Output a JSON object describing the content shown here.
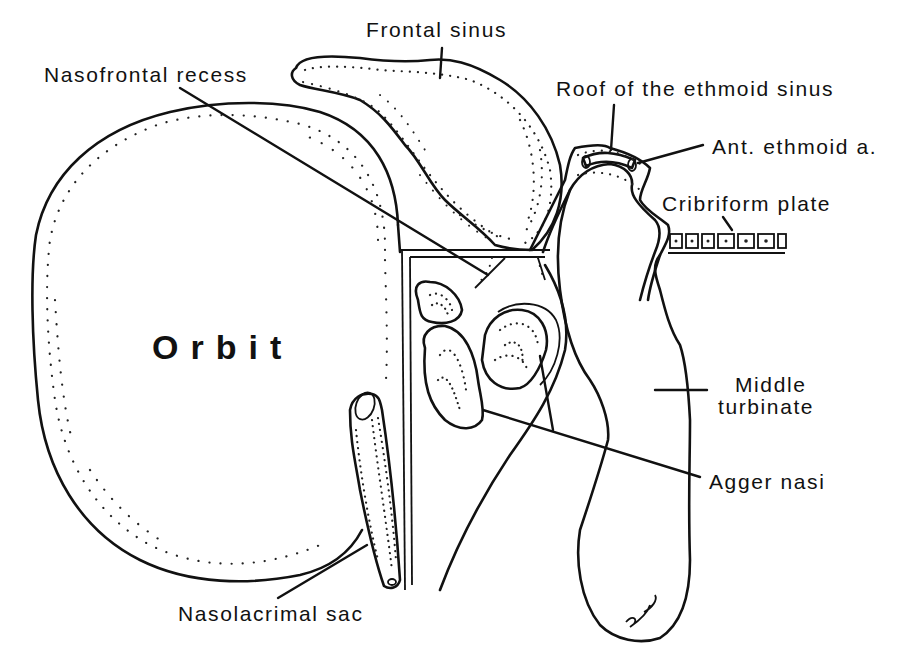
{
  "figure": {
    "type": "anatomical line drawing",
    "colors": {
      "ink": "#111111",
      "background": "#ffffff"
    }
  },
  "labels": {
    "frontal_sinus": "Frontal sinus",
    "nasofrontal_recess": "Nasofrontal recess",
    "roof_ethmoid": "Roof of the ethmoid sinus",
    "ant_ethmoid_artery": "Ant. ethmoid a.",
    "cribriform_plate": "Cribriform plate",
    "orbit": "Orbit",
    "middle_turbinate_line1": "Middle",
    "middle_turbinate_line2": "turbinate",
    "agger_nasi": "Agger nasi",
    "nasolacrimal_sac": "Nasolacrimal sac"
  },
  "signature": "JPC",
  "structures": [
    "orbit",
    "frontal-sinus",
    "ethmoid-roof",
    "anterior-ethmoid-artery",
    "cribriform-plate",
    "middle-turbinate",
    "agger-nasi-cells",
    "nasolacrimal-sac",
    "lamina-papyracea"
  ]
}
